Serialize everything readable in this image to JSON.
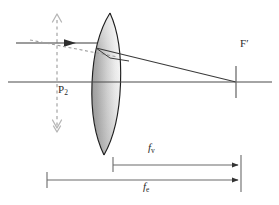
{
  "figure": {
    "kind": "optical-ray-diagram",
    "width": 279,
    "height": 205,
    "background": "#ffffff"
  },
  "colors": {
    "line": "#4a4a4a",
    "ray": "#3a3a3a",
    "lens_outline": "#1f1f1f",
    "lens_fill_dark": "#9b9b9b",
    "lens_fill_light": "#f2f2f2",
    "dashed": "#b6b6b6",
    "dimension": "#6b6b6b",
    "text": "#2b2b2b"
  },
  "labels": {
    "principal_plane": {
      "text": "P",
      "sub": "2"
    },
    "rear_focal_point": {
      "text": "F",
      "prime": "′"
    },
    "back_focal_distance": {
      "text": "f",
      "sub": "v"
    },
    "effective_focal_length": {
      "text": "f",
      "sub": "e"
    }
  },
  "elements": {
    "optical_axis": {
      "name": "optical-axis",
      "x1": 8,
      "y1": 82,
      "x2": 272,
      "y2": 82
    },
    "principal_plane_line": {
      "name": "principal-plane-dashed-line",
      "x": 57,
      "y_top": 14,
      "y_bottom": 132
    },
    "incoming_ray": {
      "name": "incoming-parallel-ray",
      "x1": 16,
      "y1": 43,
      "x2": 95,
      "y2": 43
    },
    "dashed_construction_ray": {
      "name": "dashed-construction-ray",
      "x1": 30,
      "y1": 41,
      "x2": 112,
      "y2": 56
    },
    "refracted_ray": {
      "name": "refracted-ray",
      "x1": 95,
      "y1": 49,
      "x2": 236,
      "y2": 82
    },
    "focal_tick": {
      "name": "focal-point-tick",
      "x": 236,
      "y_top": 68,
      "y_bottom": 96
    },
    "lens": {
      "name": "meniscus-lens",
      "shape": "meniscus",
      "top_y": 13,
      "bottom_y": 155,
      "front_x": 92,
      "back_x": 114
    },
    "dimension_back_focal": {
      "name": "dimension-back-focal-distance",
      "x_start": 113,
      "x_end": 241,
      "y": 165
    },
    "dimension_effective_focal": {
      "name": "dimension-effective-focal-length",
      "x_start": 47,
      "x_end": 241,
      "y": 180
    }
  }
}
